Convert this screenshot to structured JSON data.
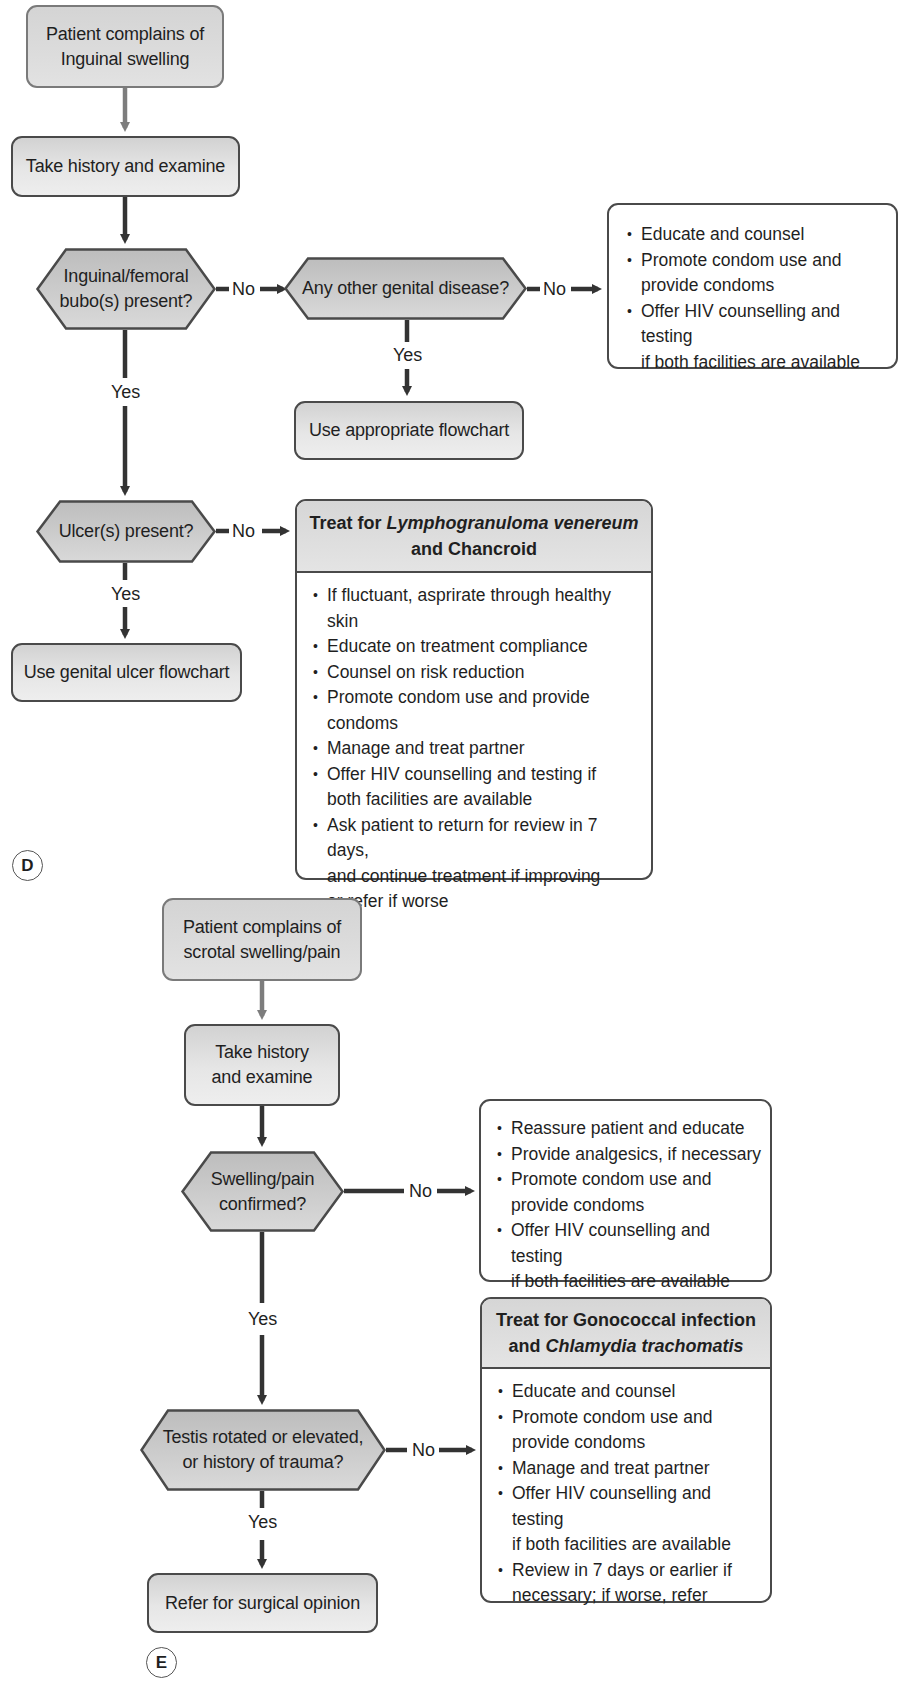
{
  "diagram_d": {
    "label": "D",
    "start": "Patient complains of Inguinal swelling",
    "start_lines": [
      "Patient complains of",
      "Inguinal swelling"
    ],
    "history": "Take history and examine",
    "decision_bubo": [
      "Inguinal/femoral",
      "bubo(s) present?"
    ],
    "decision_other": "Any other genital disease?",
    "other_yes": "Use appropriate flowchart",
    "decision_ulcer": "Ulcer(s) present?",
    "ulcer_yes": "Use genital ulcer flowchart",
    "labels": {
      "no": "No",
      "yes": "Yes"
    },
    "counsel_box": {
      "items": [
        "Educate and counsel",
        "Promote condom use and provide condoms",
        "Offer HIV counselling and testing if both facilities are available"
      ],
      "lines": [
        [
          "Educate and counsel"
        ],
        [
          "Promote condom use and",
          "provide condoms"
        ],
        [
          "Offer HIV counselling and testing",
          "if both facilities are available"
        ]
      ]
    },
    "treat_box": {
      "title_prefix": "Treat for ",
      "title_italic": "Lymphogranuloma venereum",
      "title_suffix": "and Chancroid",
      "items": [
        "If fluctuant, asprirate through healthy skin",
        "Educate on treatment compliance",
        "Counsel on risk reduction",
        "Promote condom use and provide condoms",
        "Manage and treat partner",
        "Offer HIV counselling and testing if both facilities are available",
        "Ask patient to return for review in 7 days, and continue treatment if improving or refer if worse"
      ],
      "lines": [
        [
          "If fluctuant, asprirate through healthy skin"
        ],
        [
          "Educate on treatment compliance"
        ],
        [
          "Counsel on risk reduction"
        ],
        [
          "Promote condom use and provide",
          "condoms"
        ],
        [
          "Manage and treat partner"
        ],
        [
          "Offer HIV counselling and testing if",
          "both facilities are available"
        ],
        [
          "Ask patient to return for review in 7 days,",
          "and continue treatment if improving",
          "or refer if worse"
        ]
      ]
    }
  },
  "diagram_e": {
    "label": "E",
    "start_lines": [
      "Patient complains of",
      "scrotal swelling/pain"
    ],
    "history_lines": [
      "Take history",
      "and examine"
    ],
    "decision_swelling": [
      "Swelling/pain",
      "confirmed?"
    ],
    "decision_testis": [
      "Testis rotated or elevated,",
      "or history of trauma?"
    ],
    "testis_yes": "Refer for surgical opinion",
    "labels": {
      "no": "No",
      "yes": "Yes"
    },
    "reassure_box": {
      "lines": [
        [
          "Reassure patient and educate"
        ],
        [
          "Provide analgesics, if necessary"
        ],
        [
          "Promote condom use and",
          "provide condoms"
        ],
        [
          "Offer HIV counselling and testing",
          "if both facilities are available"
        ]
      ]
    },
    "treat_box": {
      "title_line1": "Treat for Gonococcal infection",
      "title_prefix": "and ",
      "title_italic": "Chlamydia trachomatis",
      "lines": [
        [
          "Educate and counsel"
        ],
        [
          "Promote condom use and",
          "provide condoms"
        ],
        [
          "Manage and treat partner"
        ],
        [
          "Offer HIV counselling and testing",
          "if both facilities are available"
        ],
        [
          "Review in 7 days or earlier if",
          "necessary; if worse, refer"
        ]
      ]
    }
  },
  "colors": {
    "box_border": "#4a4a4a",
    "start_border": "#7a7a7a",
    "start_arrow": "#7d7d7d",
    "arrow": "#333333",
    "hex_fill": "#c9c9c9",
    "box_fill": "#e2e2e2"
  }
}
